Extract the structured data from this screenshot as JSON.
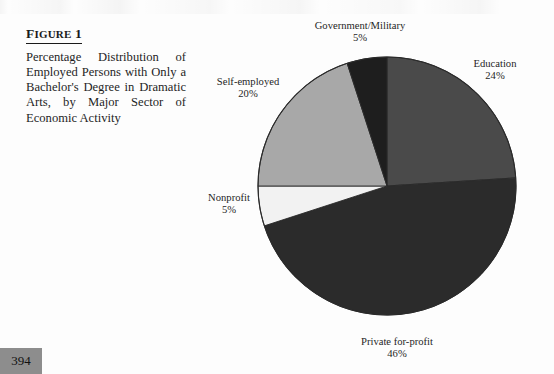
{
  "figure": {
    "label": "Figure 1",
    "label_first": "F",
    "label_rest": "IGURE",
    "label_number": "1",
    "caption": "Percentage Distribution of Employed Persons with Only a Bachelor's Degree in Dramatic Arts, by Major Sector of Economic Activity"
  },
  "page_number": "394",
  "chart_data": {
    "type": "pie",
    "title": "Percentage Distribution of Employed Persons with Only a Bachelor's Degree in Dramatic Arts, by Major Sector of Economic Activity",
    "xlabel": "",
    "ylabel": "",
    "legend_position": "none",
    "labels_outside": true,
    "start_angle_deg": 0,
    "direction": "clockwise",
    "categories": [
      "Education",
      "Private for-profit",
      "Nonprofit",
      "Self-employed",
      "Government/Military"
    ],
    "values": [
      24,
      46,
      5,
      20,
      5
    ],
    "value_suffix": "%",
    "colors": [
      "#4a4a4a",
      "#2b2b2b",
      "#f2f2f2",
      "#a8a8a8",
      "#1e1e1e"
    ],
    "slices": [
      {
        "name": "Education",
        "value": 24,
        "display": "24%",
        "color": "#4a4a4a"
      },
      {
        "name": "Private for-profit",
        "value": 46,
        "display": "46%",
        "color": "#2b2b2b"
      },
      {
        "name": "Nonprofit",
        "value": 5,
        "display": "5%",
        "color": "#f2f2f2"
      },
      {
        "name": "Self-employed",
        "value": 20,
        "display": "20%",
        "color": "#a8a8a8"
      },
      {
        "name": "Government/Military",
        "value": 5,
        "display": "5%",
        "color": "#1e1e1e"
      }
    ]
  }
}
